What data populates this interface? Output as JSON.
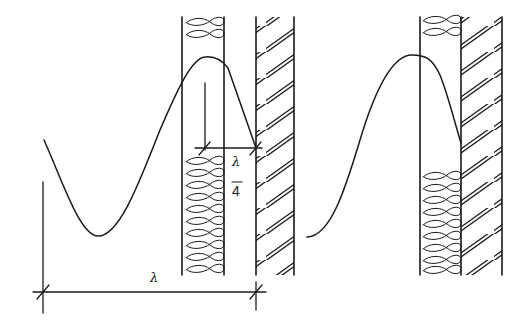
{
  "diagram": {
    "title": "",
    "colors": {
      "ink": "#1a1a1a",
      "background": "#ffffff"
    },
    "left_panel": {
      "dimension_quarter": {
        "numerator": "λ",
        "bar": "—",
        "denominator": "4"
      },
      "dimension_full": {
        "label": "λ"
      }
    },
    "right_panel": {}
  }
}
